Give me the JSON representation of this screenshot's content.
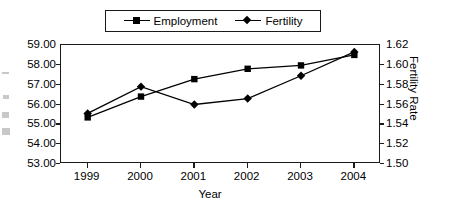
{
  "chart_data": {
    "type": "line",
    "title": "",
    "xlabel": "Year",
    "ylabel": "",
    "y2label": "Fertility Rate",
    "categories": [
      "1999",
      "2000",
      "2001",
      "2002",
      "2003",
      "2004"
    ],
    "x": [
      1999,
      2000,
      2001,
      2002,
      2003,
      2004
    ],
    "ylim": [
      53.0,
      59.0
    ],
    "y2lim": [
      1.5,
      1.62
    ],
    "yticks": [
      "59.00",
      "58.00",
      "57.00",
      "56.00",
      "55.00",
      "54.00",
      "53.00"
    ],
    "ytick_values": [
      59.0,
      58.0,
      57.0,
      56.0,
      55.0,
      54.0,
      53.0
    ],
    "y2ticks": [
      "1.62",
      "1.60",
      "1.58",
      "1.56",
      "1.54",
      "1.52",
      "1.50"
    ],
    "y2tick_values": [
      1.62,
      1.6,
      1.58,
      1.56,
      1.54,
      1.52,
      1.5
    ],
    "grid": false,
    "legend_position": "top-center",
    "series": [
      {
        "name": "Employment",
        "axis": "left",
        "marker": "square",
        "values": [
          55.35,
          56.4,
          57.28,
          57.8,
          57.97,
          58.5
        ]
      },
      {
        "name": "Fertility",
        "axis": "right",
        "marker": "diamond",
        "values": [
          1.551,
          1.578,
          1.56,
          1.566,
          1.589,
          1.613
        ]
      }
    ]
  },
  "legend": {
    "items": [
      {
        "label": "Employment",
        "marker": "square"
      },
      {
        "label": "Fertility",
        "marker": "diamond"
      }
    ]
  },
  "axes": {
    "x_title": "Year",
    "y2_title": "Fertility Rate"
  },
  "colors": {
    "line": "#000000",
    "marker": "#000000",
    "axis": "#1a1a1a",
    "background": "#ffffff"
  }
}
